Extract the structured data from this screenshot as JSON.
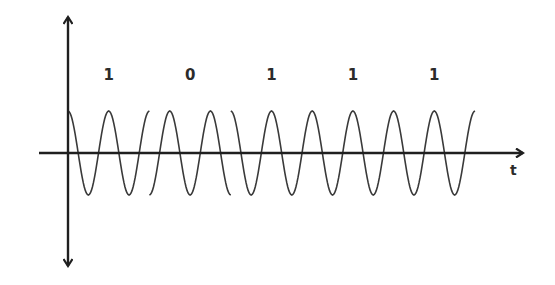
{
  "diagram": {
    "type": "phase-shift-keying-waveform",
    "axes": {
      "x_label": "t",
      "x_axis_y": 153,
      "x_start": 39,
      "x_end": 523,
      "y_axis_x": 68,
      "y_top": 17,
      "y_bottom": 266
    },
    "bits": [
      "1",
      "0",
      "1",
      "1",
      "1"
    ],
    "signal": {
      "start_x": 68,
      "segment_width": 81.4,
      "cycles_per_bit": 2,
      "amplitude": 42,
      "phase_bit_1": 0,
      "phase_bit_0": 180
    },
    "colors": {
      "axis": "#1f1f1f",
      "wave": "#3a3a3a",
      "text": "#2b2b2b",
      "background": "#ffffff"
    }
  }
}
